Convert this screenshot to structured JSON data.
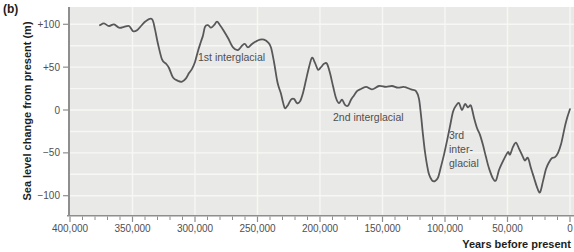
{
  "figure_label": "(b)",
  "colors": {
    "plot_bg": "#e9e9e7",
    "gridline": "#f7f7f5",
    "curve": "#58585a",
    "axis": "#8e8e8e",
    "tick_text": "#4f4f51",
    "label_text": "#1d1d1b"
  },
  "chart_data": {
    "type": "line",
    "title": "",
    "xlabel": "Years before present",
    "ylabel": "Sea level change from present (m)",
    "xlim": [
      400000,
      0
    ],
    "ylim": [
      -122,
      120
    ],
    "grid": {
      "horizontal_step_m": 25,
      "vertical_at_major_ticks": true
    },
    "x_major_ticks": [
      400000,
      350000,
      300000,
      250000,
      200000,
      150000,
      100000,
      50000,
      0
    ],
    "x_major_tick_labels": [
      "400,000",
      "350,000",
      "300,000",
      "250,000",
      "200,000",
      "150,000",
      "100,000",
      "50,000",
      "0"
    ],
    "x_minor_tick_step": 10000,
    "y_ticks": [
      100,
      50,
      0,
      -50,
      -100
    ],
    "y_tick_labels": [
      "+100",
      "+50",
      "0",
      "−50",
      "−100"
    ],
    "v_grid_years": [
      350000,
      300000,
      250000,
      200000,
      150000,
      100000,
      50000,
      0
    ],
    "series": [
      {
        "name": "sea-level-change",
        "points": [
          [
            376000,
            99
          ],
          [
            372800,
            101
          ],
          [
            368800,
            98
          ],
          [
            364800,
            100
          ],
          [
            360800,
            96
          ],
          [
            356800,
            97
          ],
          [
            352800,
            98
          ],
          [
            349600,
            92
          ],
          [
            346400,
            93
          ],
          [
            343200,
            98
          ],
          [
            339200,
            104
          ],
          [
            334400,
            106
          ],
          [
            332000,
            94
          ],
          [
            329600,
            77
          ],
          [
            326400,
            59
          ],
          [
            323200,
            54
          ],
          [
            320800,
            49
          ],
          [
            317600,
            38
          ],
          [
            313600,
            34
          ],
          [
            310400,
            33
          ],
          [
            307200,
            37
          ],
          [
            304800,
            43
          ],
          [
            302400,
            48
          ],
          [
            300000,
            56
          ],
          [
            297600,
            69
          ],
          [
            295200,
            80
          ],
          [
            293600,
            87
          ],
          [
            292000,
            97
          ],
          [
            289600,
            99
          ],
          [
            287200,
            96
          ],
          [
            284800,
            99
          ],
          [
            282400,
            103
          ],
          [
            280000,
            99
          ],
          [
            276800,
            92
          ],
          [
            273600,
            84
          ],
          [
            269600,
            73
          ],
          [
            265600,
            70
          ],
          [
            262400,
            75
          ],
          [
            260000,
            77
          ],
          [
            257600,
            73
          ],
          [
            254400,
            77
          ],
          [
            251200,
            80
          ],
          [
            248000,
            82
          ],
          [
            244800,
            82
          ],
          [
            241600,
            79
          ],
          [
            239200,
            73
          ],
          [
            236800,
            56
          ],
          [
            234400,
            35
          ],
          [
            232800,
            26
          ],
          [
            231200,
            19
          ],
          [
            229600,
            9
          ],
          [
            228000,
            2
          ],
          [
            225600,
            6
          ],
          [
            223200,
            12
          ],
          [
            220800,
            13
          ],
          [
            218400,
            8
          ],
          [
            216000,
            10
          ],
          [
            213600,
            20
          ],
          [
            211200,
            35
          ],
          [
            208800,
            50
          ],
          [
            206400,
            61
          ],
          [
            204000,
            55
          ],
          [
            201600,
            47
          ],
          [
            199200,
            50
          ],
          [
            196800,
            54
          ],
          [
            194400,
            54
          ],
          [
            192000,
            43
          ],
          [
            189600,
            28
          ],
          [
            187200,
            14
          ],
          [
            184800,
            8
          ],
          [
            182400,
            12
          ],
          [
            180000,
            6
          ],
          [
            177600,
            5
          ],
          [
            175200,
            12
          ],
          [
            172800,
            17
          ],
          [
            170400,
            22
          ],
          [
            168000,
            24
          ],
          [
            163200,
            27
          ],
          [
            158400,
            24
          ],
          [
            152800,
            28
          ],
          [
            147200,
            27
          ],
          [
            142400,
            28
          ],
          [
            137600,
            26
          ],
          [
            132800,
            27
          ],
          [
            127200,
            24
          ],
          [
            123200,
            22
          ],
          [
            120800,
            13
          ],
          [
            119200,
            -6
          ],
          [
            117600,
            -29
          ],
          [
            116000,
            -49
          ],
          [
            114400,
            -64
          ],
          [
            112800,
            -75
          ],
          [
            110400,
            -82
          ],
          [
            108000,
            -83
          ],
          [
            105600,
            -79
          ],
          [
            103200,
            -66
          ],
          [
            100800,
            -52
          ],
          [
            98400,
            -36
          ],
          [
            96000,
            -19
          ],
          [
            93600,
            -2
          ],
          [
            91200,
            5
          ],
          [
            88800,
            8
          ],
          [
            86400,
            0
          ],
          [
            84000,
            7
          ],
          [
            81600,
            3
          ],
          [
            79200,
            5
          ],
          [
            76800,
            -9
          ],
          [
            74400,
            -21
          ],
          [
            72000,
            -29
          ],
          [
            69600,
            -41
          ],
          [
            67200,
            -55
          ],
          [
            64800,
            -68
          ],
          [
            61600,
            -80
          ],
          [
            59200,
            -82
          ],
          [
            56800,
            -70
          ],
          [
            54400,
            -62
          ],
          [
            52000,
            -55
          ],
          [
            49600,
            -49
          ],
          [
            48000,
            -52
          ],
          [
            45600,
            -43
          ],
          [
            43200,
            -38
          ],
          [
            40800,
            -45
          ],
          [
            37600,
            -55
          ],
          [
            36000,
            -59
          ],
          [
            33600,
            -56
          ],
          [
            31200,
            -68
          ],
          [
            28800,
            -79
          ],
          [
            26400,
            -90
          ],
          [
            24000,
            -96
          ],
          [
            21600,
            -83
          ],
          [
            19200,
            -69
          ],
          [
            16800,
            -61
          ],
          [
            14400,
            -56
          ],
          [
            12000,
            -55
          ],
          [
            9600,
            -50
          ],
          [
            7200,
            -40
          ],
          [
            4800,
            -24
          ],
          [
            3200,
            -14
          ],
          [
            1600,
            -6
          ],
          [
            0,
            1
          ]
        ]
      }
    ],
    "annotations": [
      {
        "lines": [
          "1st interglacial"
        ],
        "years": 297600,
        "m": 61
      },
      {
        "lines": [
          "2nd interglacial"
        ],
        "years": 189600,
        "m": -9
      },
      {
        "lines": [
          "3rd",
          "inter-",
          "glacial"
        ],
        "years": 96800,
        "m": -30
      }
    ]
  }
}
